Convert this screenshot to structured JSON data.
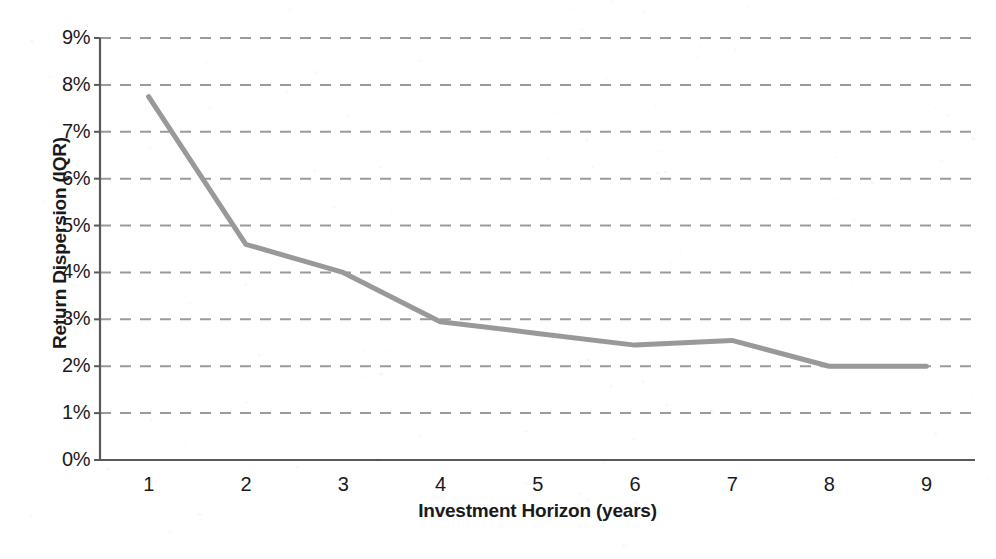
{
  "chart_data": {
    "type": "line",
    "title": "",
    "subtitle": "",
    "xlabel": "Investment Horizon (years)",
    "ylabel": "Return Dispersion (IQR)",
    "x": [
      1,
      2,
      3,
      4,
      5,
      6,
      7,
      8,
      9
    ],
    "values": [
      7.75,
      4.6,
      4.0,
      2.95,
      2.7,
      2.45,
      2.55,
      2.0,
      2.0
    ],
    "series": [
      {
        "name": "Return Dispersion (IQR)",
        "values": [
          7.75,
          4.6,
          4.0,
          2.95,
          2.7,
          2.45,
          2.55,
          2.0,
          2.0
        ]
      }
    ],
    "xlim": [
      0.5,
      9.5
    ],
    "ylim": [
      0,
      9
    ],
    "x_tick_labels": [
      "1",
      "2",
      "3",
      "4",
      "5",
      "6",
      "7",
      "8",
      "9"
    ],
    "y_tick_labels": [
      "0%",
      "1%",
      "2%",
      "3%",
      "4%",
      "5%",
      "6%",
      "7%",
      "8%",
      "9%"
    ],
    "y_tick_values": [
      0,
      1,
      2,
      3,
      4,
      5,
      6,
      7,
      8,
      9
    ],
    "grid": "horizontal-dashed",
    "legend": "none",
    "line_color": "#999999",
    "line_width": 5,
    "axis_color": "#595959",
    "gridline_color": "#9a9a9a",
    "markers": "none",
    "annotations": []
  },
  "axes": {
    "y_title": "Return Dispersion (IQR)",
    "x_title": "Investment Horizon (years)"
  },
  "colors": {
    "background": "#ffffff",
    "line": "#999999",
    "gridline": "#9a9a9a",
    "axis": "#595959",
    "text": "#1a1a1a"
  }
}
